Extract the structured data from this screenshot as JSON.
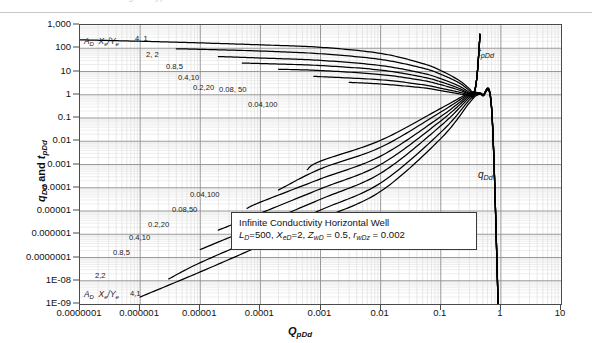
{
  "figure": {
    "top_caption_faint": "Fig. — type curves",
    "ylabel": "q_Dd and t_pDd",
    "xlabel": "Q_pDd"
  },
  "annotation": {
    "line1": "Infinite Conductivity Horizontal  Well",
    "line2_prefix": "L",
    "line2": "L_D=500, X_eD=2, Z_wD = 0.5, r_wDz = 0.002"
  },
  "series_labels": {
    "upper": "t_pDd",
    "lower": "q_Dd"
  },
  "family_header": "A_D  X_e/Y_e",
  "curve_labels_upper": [
    "4, 1",
    "2, 2",
    "0.8,5",
    "0.4,10",
    "0.2,20",
    "0.08, 50",
    "0.04,100"
  ],
  "curve_labels_lower": [
    "4,1",
    "2,2",
    "0.8,5",
    "0.4,10",
    "0.2,20",
    "0.08,50",
    "0.04,100"
  ],
  "chart_data": {
    "type": "line",
    "title": "",
    "subtitle": "Infinite Conductivity Horizontal  Well",
    "xlabel": "Q_pDd",
    "ylabel": "q_Dd and t_pDd",
    "xscale": "log",
    "yscale": "log",
    "xlim": [
      1e-07,
      10
    ],
    "ylim": [
      1e-09,
      1000
    ],
    "grid": true,
    "minor_grid": true,
    "legend": "none",
    "xticks": [
      "0.0000001",
      "0.000001",
      "0.00001",
      "0.0001",
      "0.001",
      "0.01",
      "0.1",
      "1",
      "10"
    ],
    "xtick_values": [
      1e-07,
      1e-06,
      1e-05,
      0.0001,
      0.001,
      0.01,
      0.1,
      1,
      10
    ],
    "yticks": [
      "1,000",
      "100",
      "10",
      "1",
      "0.1",
      "0.01",
      "0.001",
      "0.0001",
      "0.00001",
      "0.000001",
      "0.0000001",
      "1E-08",
      "1E-09"
    ],
    "ytick_values": [
      1000,
      100,
      10,
      1,
      0.1,
      0.01,
      0.001,
      0.0001,
      1e-05,
      1e-06,
      1e-07,
      1e-08,
      1e-09
    ],
    "parameters": {
      "L_D": 500,
      "X_eD": 2,
      "Z_wD": 0.5,
      "r_wDz": 0.002
    },
    "family_parameter": "A_D, X_e/Y_e",
    "series": [
      {
        "name": "t_pDd 4, 1",
        "A_D": 4,
        "Xe_Ye": 1,
        "group": "t_pDd",
        "x": [
          1e-07,
          1e-06,
          1e-05,
          0.0001,
          0.001,
          0.01,
          0.05,
          0.1,
          0.2,
          0.3,
          0.35,
          0.4,
          0.45
        ],
        "y": [
          230,
          200,
          170,
          140,
          110,
          60,
          22,
          11,
          4.2,
          1.8,
          1.2,
          6,
          400
        ]
      },
      {
        "name": "t_pDd 2, 2",
        "A_D": 2,
        "Xe_Ye": 2,
        "group": "t_pDd",
        "x": [
          4e-06,
          1e-05,
          0.0001,
          0.001,
          0.01,
          0.05,
          0.1,
          0.2,
          0.3,
          0.35,
          0.4,
          0.45
        ],
        "y": [
          95,
          90,
          76,
          58,
          33,
          14,
          7.6,
          3.3,
          1.5,
          1.1,
          6,
          400
        ]
      },
      {
        "name": "t_pDd 0.8,5",
        "A_D": 0.8,
        "Xe_Ye": 5,
        "group": "t_pDd",
        "x": [
          2e-05,
          0.0001,
          0.001,
          0.01,
          0.05,
          0.1,
          0.2,
          0.3,
          0.35,
          0.4,
          0.45
        ],
        "y": [
          44,
          38,
          30,
          18,
          8.4,
          4.9,
          2.4,
          1.25,
          1.0,
          6,
          400
        ]
      },
      {
        "name": "t_pDd 0.4,10",
        "A_D": 0.4,
        "Xe_Ye": 10,
        "group": "t_pDd",
        "x": [
          5e-05,
          0.0001,
          0.001,
          0.01,
          0.05,
          0.1,
          0.2,
          0.3,
          0.35,
          0.4,
          0.45
        ],
        "y": [
          23,
          22,
          18,
          11.5,
          5.8,
          3.6,
          1.9,
          1.12,
          0.95,
          6,
          400
        ]
      },
      {
        "name": "t_pDd 0.2,20",
        "A_D": 0.2,
        "Xe_Ye": 20,
        "group": "t_pDd",
        "x": [
          0.0002,
          0.001,
          0.01,
          0.05,
          0.1,
          0.2,
          0.3,
          0.35,
          0.4,
          0.45
        ],
        "y": [
          12.5,
          11,
          7.4,
          4.1,
          2.7,
          1.6,
          1.05,
          0.92,
          6,
          400
        ]
      },
      {
        "name": "t_pDd 0.08, 50",
        "A_D": 0.08,
        "Xe_Ye": 50,
        "group": "t_pDd",
        "x": [
          0.0008,
          0.001,
          0.01,
          0.05,
          0.1,
          0.2,
          0.3,
          0.35,
          0.4,
          0.45
        ],
        "y": [
          6.2,
          6.0,
          4.4,
          2.7,
          1.9,
          1.3,
          0.98,
          0.9,
          6,
          400
        ]
      },
      {
        "name": "t_pDd 0.04,100",
        "A_D": 0.04,
        "Xe_Ye": 100,
        "group": "t_pDd",
        "x": [
          0.003,
          0.01,
          0.05,
          0.1,
          0.2,
          0.3,
          0.35,
          0.4,
          0.45
        ],
        "y": [
          3.4,
          2.9,
          2.0,
          1.5,
          1.1,
          0.92,
          0.86,
          6,
          400
        ]
      },
      {
        "name": "q_Dd 4,1",
        "A_D": 4,
        "Xe_Ye": 1,
        "group": "q_Dd",
        "x": [
          1e-06,
          1e-05,
          0.0001,
          0.001,
          0.01,
          0.1,
          0.3,
          0.4,
          0.5,
          0.7,
          0.9
        ],
        "y": [
          2e-09,
          2.4e-08,
          3.2e-07,
          4.5e-06,
          7e-05,
          0.013,
          0.45,
          0.95,
          0.9,
          0.25,
          1e-09
        ]
      },
      {
        "name": "q_Dd 2,2",
        "A_D": 2,
        "Xe_Ye": 2,
        "group": "q_Dd",
        "x": [
          3e-06,
          1e-05,
          0.0001,
          0.001,
          0.01,
          0.1,
          0.3,
          0.4,
          0.5,
          0.7,
          0.9
        ],
        "y": [
          1.2e-08,
          6e-08,
          8e-07,
          1.1e-05,
          0.00016,
          0.024,
          0.6,
          1.0,
          0.92,
          0.26,
          1e-09
        ]
      },
      {
        "name": "q_Dd 0.8,5",
        "A_D": 0.8,
        "Xe_Ye": 5,
        "group": "q_Dd",
        "x": [
          1e-05,
          0.0001,
          0.001,
          0.01,
          0.1,
          0.3,
          0.4,
          0.5,
          0.7,
          0.9
        ],
        "y": [
          2.2e-07,
          2.6e-06,
          3.2e-05,
          0.00042,
          0.046,
          0.75,
          1.05,
          0.95,
          0.27,
          1e-09
        ]
      },
      {
        "name": "q_Dd 0.4,10",
        "A_D": 0.4,
        "Xe_Ye": 10,
        "group": "q_Dd",
        "x": [
          2e-05,
          0.0001,
          0.001,
          0.01,
          0.1,
          0.3,
          0.4,
          0.5,
          0.7,
          0.9
        ],
        "y": [
          1.5e-06,
          8e-06,
          9e-05,
          0.001,
          0.075,
          0.88,
          1.1,
          0.97,
          0.28,
          1e-09
        ]
      },
      {
        "name": "q_Dd 0.2,20",
        "A_D": 0.2,
        "Xe_Ye": 20,
        "group": "q_Dd",
        "x": [
          6e-05,
          0.0001,
          0.001,
          0.01,
          0.1,
          0.3,
          0.4,
          0.5,
          0.7,
          0.9
        ],
        "y": [
          1.3e-05,
          2.4e-05,
          0.00024,
          0.0023,
          0.115,
          1.0,
          1.15,
          0.99,
          0.29,
          1e-09
        ]
      },
      {
        "name": "q_Dd 0.08,50",
        "A_D": 0.08,
        "Xe_Ye": 50,
        "group": "q_Dd",
        "x": [
          0.0002,
          0.001,
          0.01,
          0.1,
          0.3,
          0.4,
          0.5,
          0.7,
          0.9
        ],
        "y": [
          8e-05,
          0.00065,
          0.0055,
          0.18,
          1.1,
          1.2,
          1.0,
          0.3,
          1e-09
        ]
      },
      {
        "name": "q_Dd 0.04,100",
        "A_D": 0.04,
        "Xe_Ye": 100,
        "group": "q_Dd",
        "x": [
          0.0006,
          0.001,
          0.01,
          0.1,
          0.3,
          0.4,
          0.5,
          0.7,
          0.9
        ],
        "y": [
          0.0006,
          0.0014,
          0.011,
          0.26,
          1.2,
          1.25,
          1.02,
          0.31,
          1e-09
        ]
      }
    ],
    "annotations": [
      {
        "text": "Infinite Conductivity Horizontal  Well",
        "kind": "textbox-line1"
      },
      {
        "text": "L_D=500, X_eD=2, Z_wD = 0.5, r_wDz = 0.002",
        "kind": "textbox-line2"
      },
      {
        "text": "t_pDd",
        "kind": "series-label",
        "position": "upper-right"
      },
      {
        "text": "q_Dd",
        "kind": "series-label",
        "position": "lower-right"
      }
    ]
  }
}
